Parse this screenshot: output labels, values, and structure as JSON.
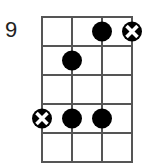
{
  "diagram": {
    "type": "fretboard",
    "starting_fret_label": "9",
    "strings": 4,
    "frets": 5,
    "grid": {
      "x0": 42,
      "y0": 17,
      "string_spacing": 30,
      "fret_spacing": 29,
      "line_color": "#555555",
      "line_width": 2
    },
    "dot_radius": 10,
    "dot_color": "#000000",
    "root_marker_color": "#000000",
    "notes": [
      {
        "string": 3,
        "fret": 1,
        "type": "dot"
      },
      {
        "string": 4,
        "fret": 1,
        "type": "root"
      },
      {
        "string": 2,
        "fret": 2,
        "type": "dot"
      },
      {
        "string": 1,
        "fret": 4,
        "type": "root"
      },
      {
        "string": 2,
        "fret": 4,
        "type": "dot"
      },
      {
        "string": 3,
        "fret": 4,
        "type": "dot"
      }
    ]
  }
}
